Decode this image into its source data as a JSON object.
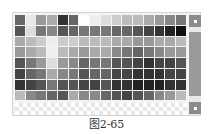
{
  "palette": {
    "columns": 16,
    "rows": [
      [
        "#666666",
        "#e8e8e8",
        "#999999",
        "#aaaaaa",
        "#333333",
        "#666666",
        "#ffffff",
        "#eeeeee",
        "#dddddd",
        "#cccccc",
        "#bbbbbb",
        "#bbbbbb",
        "#aaaaaa",
        "#999999",
        "#888888",
        "#777777"
      ],
      [
        "#555555",
        "#dddddd",
        "#777777",
        "#888888",
        "#555555",
        "#666666",
        "#777777",
        "#777777",
        "#777777",
        "#666666",
        "#666666",
        "#555555",
        "#444444",
        "#333333",
        "#222222",
        "#111111"
      ],
      [
        "#aaaaaa",
        "#bbbbbb",
        "#cccccc",
        "#eeeeee",
        "#cccccc",
        "#cccccc",
        "#bbbbbb",
        "#bbbbbb",
        "#bbbbbb",
        "#aaaaaa",
        "#aaaaaa",
        "#999999",
        "#999999",
        "#aaaaaa",
        "#aaaaaa",
        "#bbbbbb"
      ],
      [
        "#999999",
        "#aaaaaa",
        "#bbbbbb",
        "#eeeeee",
        "#bbbbbb",
        "#aaaaaa",
        "#999999",
        "#aaaaaa",
        "#aaaaaa",
        "#888888",
        "#777777",
        "#666666",
        "#777777",
        "#888888",
        "#999999",
        "#999999"
      ],
      [
        "#555555",
        "#777777",
        "#999999",
        "#dddddd",
        "#999999",
        "#888888",
        "#666666",
        "#777777",
        "#777777",
        "#555555",
        "#555555",
        "#444444",
        "#333333",
        "#444444",
        "#444444",
        "#555555"
      ],
      [
        "#444444",
        "#666666",
        "#777777",
        "#aaaaaa",
        "#888888",
        "#777777",
        "#555555",
        "#666666",
        "#666666",
        "#444444",
        "#444444",
        "#333333",
        "#333333",
        "#333333",
        "#444444",
        "#444444"
      ],
      [
        "#333333",
        "#444444",
        "#555555",
        "#777777",
        "#555555",
        "#555555",
        "#444444",
        "#444444",
        "#555555",
        "#333333",
        "#333333",
        "#222222",
        "#222222",
        "#222222",
        "#333333",
        "#333333"
      ],
      [
        "#bbbbbb",
        "#888888",
        "#777777",
        "#666666",
        "#555555",
        "#aaaaaa",
        "#888888",
        "#888888",
        "#666666",
        "#555555",
        "#444444",
        "#555555",
        "#666666",
        "#888888",
        "#999999",
        "#bbbbbb"
      ]
    ],
    "transparent_row": true
  },
  "scrollbar": {
    "up_icon": "arrow-up-icon",
    "down_icon": "arrow-down-icon"
  },
  "caption": "图2-65"
}
